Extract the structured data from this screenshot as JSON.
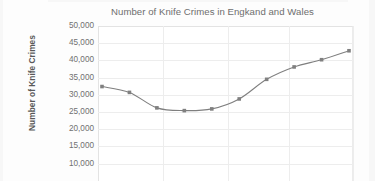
{
  "chart_data": {
    "type": "line",
    "title": "Number of Knife Crimes in Engkand and Wales",
    "xlabel": "",
    "ylabel": "Number of Knife Crimes",
    "ylim": [
      10000,
      50000
    ],
    "ytick_labels": [
      "50,000",
      "45,000",
      "40,000",
      "35,000",
      "30,000",
      "25,000",
      "20,000",
      "15,000",
      "10,000"
    ],
    "ytick_values": [
      50000,
      45000,
      40000,
      35000,
      30000,
      25000,
      20000,
      15000,
      10000
    ],
    "grid": true,
    "legend": "none",
    "series": [
      {
        "name": "Number of Knife Crimes",
        "color": "#7f7f7f",
        "marker": "square",
        "values": [
          32400,
          30700,
          26200,
          25400,
          25900,
          28800,
          34500,
          38100,
          40200,
          42800
        ]
      }
    ],
    "x_indices": [
      0,
      1,
      2,
      3,
      4,
      5,
      6,
      7,
      8,
      9
    ],
    "note": "Horizontal axis category labels are cropped off the bottom of the screenshot."
  },
  "chart": {
    "title": "Number of Knife Crimes in Engkand and Wales",
    "y_axis_title": "Number of Knife Crimes"
  },
  "colors": {
    "line": "#7f7f7f",
    "marker": "#808080",
    "grid": "#ededed",
    "title_text": "#6e6e6e",
    "axis_text": "#707070",
    "axis_title_text": "#595959",
    "background": "#ffffff"
  }
}
